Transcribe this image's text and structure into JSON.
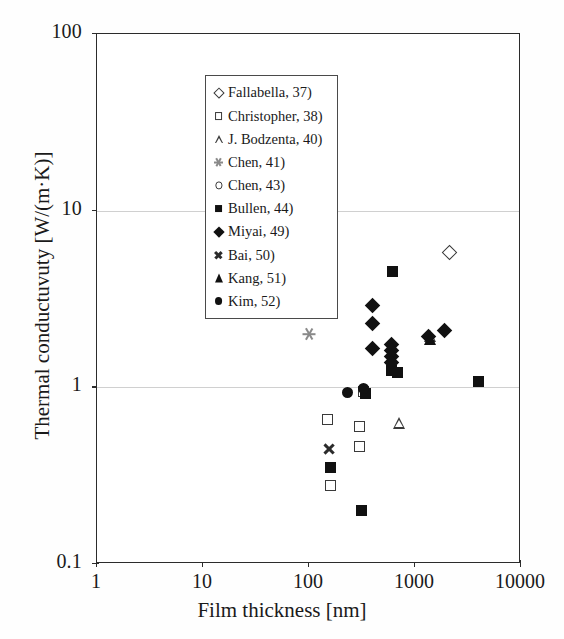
{
  "chart_data": {
    "type": "scatter",
    "title": "",
    "xlabel": "Film thickness [nm]",
    "ylabel": "Thermal conductuvuty [W/(m·K)]",
    "xscale": "log",
    "yscale": "log",
    "xlim": [
      1,
      10000
    ],
    "ylim": [
      0.1,
      100
    ],
    "xticks": [
      "1",
      "10",
      "100",
      "1000",
      "10000"
    ],
    "yticks": [
      "0.1",
      "1",
      "10",
      "100"
    ],
    "grid": "horizontal gridlines at y=1 and y=10",
    "gridlines_y": [
      1,
      10
    ],
    "legend_position": "top-left inside axes",
    "series": [
      {
        "name": "Fallabella, 37)",
        "marker": "open-diamond",
        "points": [
          [
            2100,
            5.8
          ]
        ]
      },
      {
        "name": "Christopher, 38)",
        "marker": "open-square",
        "points": [
          [
            150,
            0.66
          ],
          [
            300,
            0.6
          ],
          [
            300,
            0.46
          ],
          [
            160,
            0.28
          ],
          [
            330,
            0.95
          ]
        ]
      },
      {
        "name": "J. Bodzenta, 40)",
        "marker": "open-triangle",
        "points": [
          [
            700,
            0.63
          ],
          [
            1400,
            1.95
          ]
        ]
      },
      {
        "name": "Chen, 41)",
        "marker": "star",
        "points": [
          [
            100,
            2.0
          ]
        ]
      },
      {
        "name": "Chen, 43)",
        "marker": "open-circle",
        "points": [
          [
            21,
            4.9
          ],
          [
            45,
            4.1
          ],
          [
            90,
            4.4
          ],
          [
            105,
            4.4
          ],
          [
            125,
            4.3
          ]
        ]
      },
      {
        "name": "Bullen, 44)",
        "marker": "filled-square",
        "points": [
          [
            620,
            4.5
          ],
          [
            600,
            1.25
          ],
          [
            680,
            1.22
          ],
          [
            340,
            0.92
          ],
          [
            160,
            0.35
          ],
          [
            310,
            0.2
          ],
          [
            4000,
            1.08
          ]
        ]
      },
      {
        "name": "Miyai, 49)",
        "marker": "filled-diamond",
        "points": [
          [
            400,
            2.9
          ],
          [
            400,
            2.3
          ],
          [
            400,
            1.65
          ],
          [
            600,
            1.75
          ],
          [
            600,
            1.62
          ],
          [
            600,
            1.5
          ],
          [
            600,
            1.38
          ],
          [
            1350,
            1.95
          ],
          [
            1900,
            2.1
          ]
        ]
      },
      {
        "name": "Bai, 50)",
        "marker": "cross",
        "points": [
          [
            115,
            3.1
          ],
          [
            155,
            0.45
          ]
        ]
      },
      {
        "name": "Kang, 51)",
        "marker": "filled-triangle",
        "points": [
          [
            1400,
            1.9
          ]
        ]
      },
      {
        "name": "Kim, 52)",
        "marker": "filled-circle",
        "points": [
          [
            230,
            0.93
          ],
          [
            330,
            0.98
          ]
        ]
      }
    ]
  },
  "axes": {
    "y_label": "Thermal conductuvuty [W/(m·K)]",
    "x_label": "Film thickness [nm]",
    "y_ticks": [
      "100",
      "10",
      "1",
      "0.1"
    ],
    "x_ticks": [
      "1",
      "10",
      "100",
      "1000",
      "10000"
    ]
  },
  "legend": {
    "entries": [
      {
        "label": "Fallabella, 37)",
        "marker": "open-diamond"
      },
      {
        "label": "Christopher, 38)",
        "marker": "open-square"
      },
      {
        "label": "J. Bodzenta, 40)",
        "marker": "open-triangle"
      },
      {
        "label": "Chen, 41)",
        "marker": "star"
      },
      {
        "label": "Chen, 43)",
        "marker": "open-circle"
      },
      {
        "label": "Bullen, 44)",
        "marker": "filled-square"
      },
      {
        "label": "Miyai, 49)",
        "marker": "filled-diamond"
      },
      {
        "label": "Bai, 50)",
        "marker": "cross"
      },
      {
        "label": "Kang, 51)",
        "marker": "filled-triangle"
      },
      {
        "label": "Kim, 52)",
        "marker": "filled-circle"
      }
    ]
  },
  "colors": {
    "marker_dark": "#111111",
    "marker_outline": "#3a3a3a",
    "grid": "#d0d0d0",
    "frame": "#2b2b2b",
    "light_marker": "#8a8a8a",
    "background": "#ffffff"
  }
}
